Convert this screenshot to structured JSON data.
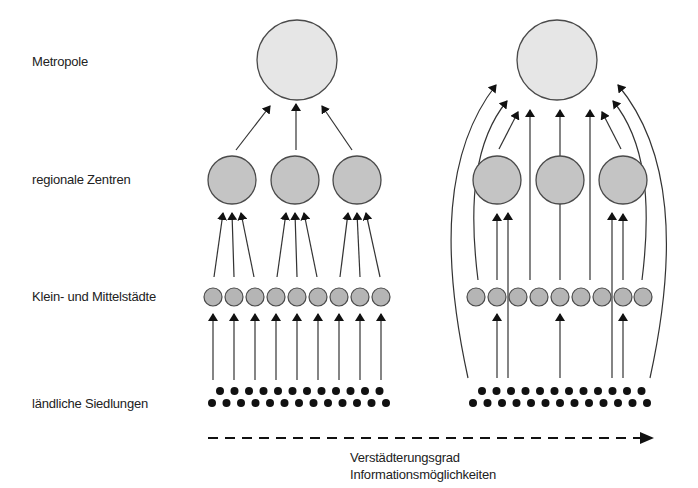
{
  "levels": {
    "metropole": "Metropole",
    "regional": "regionale Zentren",
    "small_cities": "Klein- und Mittelstädte",
    "rural": "ländliche Siedlungen"
  },
  "axis": {
    "line1": "Verstädterungsgrad",
    "line2": "Informationsmöglichkeiten"
  },
  "colors": {
    "metropole_fill": "#e6e6e6",
    "regional_fill": "#c4c4c4",
    "small_fill": "#b5b5b5",
    "stroke": "#4a4a4a",
    "dot": "#111111"
  },
  "left_model": {
    "metropole": {
      "cx": 297,
      "cy": 60,
      "r": 40
    },
    "regional": [
      {
        "cx": 232,
        "cy": 180
      },
      {
        "cx": 295,
        "cy": 180
      },
      {
        "cx": 357,
        "cy": 180
      }
    ],
    "small_cities_x": [
      213,
      234,
      255,
      276,
      297,
      318,
      339,
      360,
      381
    ],
    "rural_top_x_start": 220,
    "rural_bottom_x_start": 212
  },
  "right_model": {
    "metropole": {
      "cx": 557,
      "cy": 60,
      "r": 40
    },
    "regional": [
      {
        "cx": 497,
        "cy": 180
      },
      {
        "cx": 560,
        "cy": 180
      },
      {
        "cx": 623,
        "cy": 180
      }
    ],
    "small_cities_x": [
      476,
      497,
      518,
      539,
      560,
      581,
      602,
      623,
      643
    ],
    "rural_top_x_start": 482,
    "rural_bottom_x_start": 473
  }
}
